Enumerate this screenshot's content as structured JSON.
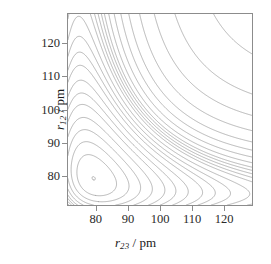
{
  "figure": {
    "kind": "contour-plot",
    "background_color": "#ffffff",
    "contour_color": "#8c8c8c",
    "frame_color": "#8c8c8c",
    "text_color": "#1a1a1a"
  },
  "axes": {
    "x": {
      "label_var": "r",
      "label_sub": "23",
      "label_sep": " / ",
      "label_unit": "pm",
      "label_full": "r23 / pm",
      "ticks": [
        "80",
        "90",
        "100",
        "110",
        "120"
      ],
      "tick_values": [
        80,
        90,
        100,
        110,
        120
      ],
      "range": [
        71,
        129
      ]
    },
    "y": {
      "label_var": "r",
      "label_sub": "12",
      "label_sep": " / ",
      "label_unit": "pm",
      "label_full": "r12 / pm",
      "ticks": [
        "80",
        "90",
        "100",
        "110",
        "120"
      ],
      "tick_values": [
        80,
        90,
        100,
        110,
        120
      ],
      "range": [
        71,
        129
      ]
    }
  },
  "chart_data": {
    "type": "line",
    "title": "",
    "subtitle": "",
    "xlabel": "r23 / pm",
    "ylabel": "r12 / pm",
    "xlim": [
      71,
      129
    ],
    "ylim": [
      71,
      129
    ],
    "grid": false,
    "legend": "none",
    "annotations": [],
    "contour_levels": [
      -0.55,
      -0.5,
      -0.45,
      -0.4,
      -0.35,
      -0.3,
      -0.26,
      -0.22,
      -0.18,
      -0.15,
      -0.12,
      -0.09,
      -0.06,
      -0.04,
      -0.02,
      0.0,
      0.02,
      0.05,
      0.09,
      0.14,
      0.2,
      0.28,
      0.38,
      0.5,
      0.66
    ],
    "n_contours": 25,
    "surface_model": {
      "form": "LEPS-like sum of two Morse wells plus coupling",
      "r_equilibrium_pm": 74,
      "saddle_point_pm": [
        96,
        96
      ],
      "valley_floor_pm": 74
    }
  }
}
